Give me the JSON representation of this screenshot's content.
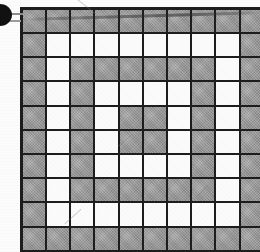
{
  "figure": {
    "description": "10 by 10 grid of square cells, each either shaded gray or white, forming a concentric ring motif",
    "rows": 10,
    "columns": 10,
    "cell_states": {
      "gray": "gray",
      "white": "white"
    },
    "colors": {
      "gray_cell": "#9a9a9a",
      "white_cell": "#fbfbfb",
      "grid_line": "#1d1d1d",
      "background": "#fcfcfc",
      "callout_marker": "#111111",
      "leader_line": "#8c8c8c"
    },
    "grid": [
      [
        "gray",
        "gray",
        "gray",
        "gray",
        "gray",
        "gray",
        "gray",
        "gray",
        "gray",
        "gray"
      ],
      [
        "gray",
        "white",
        "white",
        "white",
        "white",
        "white",
        "white",
        "white",
        "white",
        "gray"
      ],
      [
        "gray",
        "white",
        "gray",
        "gray",
        "gray",
        "gray",
        "gray",
        "gray",
        "white",
        "gray"
      ],
      [
        "gray",
        "white",
        "gray",
        "white",
        "white",
        "white",
        "white",
        "gray",
        "white",
        "gray"
      ],
      [
        "gray",
        "white",
        "gray",
        "white",
        "gray",
        "gray",
        "white",
        "gray",
        "white",
        "gray"
      ],
      [
        "gray",
        "white",
        "gray",
        "white",
        "gray",
        "gray",
        "white",
        "gray",
        "white",
        "gray"
      ],
      [
        "gray",
        "white",
        "gray",
        "white",
        "white",
        "white",
        "white",
        "gray",
        "white",
        "gray"
      ],
      [
        "gray",
        "white",
        "gray",
        "gray",
        "gray",
        "gray",
        "gray",
        "gray",
        "white",
        "gray"
      ],
      [
        "gray",
        "white",
        "white",
        "white",
        "white",
        "white",
        "white",
        "white",
        "white",
        "gray"
      ],
      [
        "gray",
        "gray",
        "gray",
        "gray",
        "gray",
        "gray",
        "gray",
        "gray",
        "gray",
        "gray"
      ]
    ]
  },
  "callout": {
    "marker_label": "",
    "marker_shape": "filled-circle",
    "leader_line_label": ""
  },
  "artifacts": {
    "scan_streak": "horizontal scan streak across top row",
    "pencil_strokes": 4
  }
}
